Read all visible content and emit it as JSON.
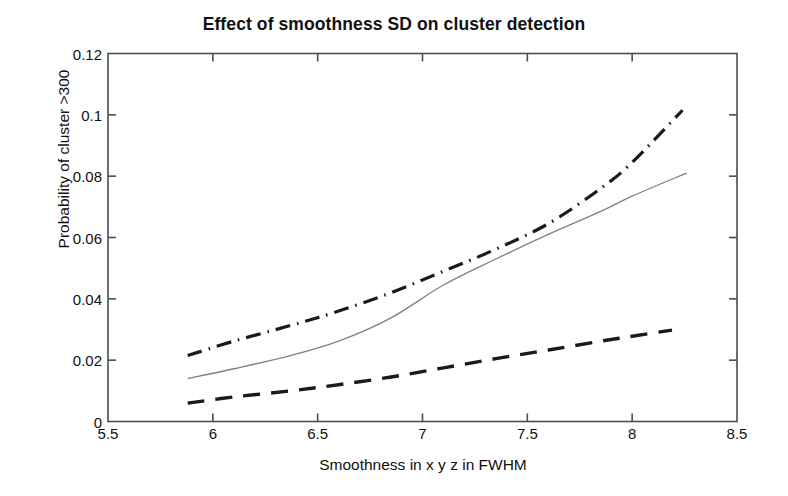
{
  "chart_data": {
    "type": "line",
    "title": "Effect of smoothness SD on cluster  detection",
    "xlabel": "Smoothness in x y z in FWHM",
    "ylabel": "Probability of cluster >300",
    "xlim": [
      5.5,
      8.5
    ],
    "ylim": [
      0,
      0.12
    ],
    "xticks": [
      "5.5",
      "6",
      "6.5",
      "7",
      "7.5",
      "8",
      "8.5"
    ],
    "xtick_values": [
      5.5,
      6,
      6.5,
      7,
      7.5,
      8,
      8.5
    ],
    "yticks": [
      "0",
      "0.02",
      "0.04",
      "0.06",
      "0.08",
      "0.1",
      "0.12"
    ],
    "ytick_values": [
      0,
      0.02,
      0.04,
      0.06,
      0.08,
      0.1,
      0.12
    ],
    "grid": false,
    "legend": "none",
    "line_color": "#1a1a1a",
    "solid_line_color": "#808080",
    "axis_color": "#4d4d4d",
    "series": [
      {
        "name": "dash-dot curve (upper)",
        "style": "dash-dot",
        "color": "#1a1a1a",
        "x": [
          5.88,
          6.1,
          6.37,
          6.6,
          6.85,
          7.1,
          7.35,
          7.6,
          7.85,
          8.0,
          8.24
        ],
        "values": [
          0.0215,
          0.0262,
          0.0313,
          0.036,
          0.042,
          0.049,
          0.0562,
          0.0645,
          0.076,
          0.0845,
          0.1015
        ]
      },
      {
        "name": "solid curve (middle)",
        "style": "solid",
        "color": "#808080",
        "x": [
          5.88,
          6.1,
          6.37,
          6.6,
          6.85,
          7.1,
          7.35,
          7.6,
          7.85,
          8.0,
          8.26
        ],
        "values": [
          0.014,
          0.0172,
          0.0215,
          0.0262,
          0.0338,
          0.0445,
          0.053,
          0.061,
          0.0685,
          0.0735,
          0.081
        ]
      },
      {
        "name": "dashed curve (lower)",
        "style": "dashed",
        "color": "#1a1a1a",
        "x": [
          5.88,
          6.1,
          6.37,
          6.6,
          6.85,
          7.1,
          7.35,
          7.6,
          7.85,
          8.0,
          8.19
        ],
        "values": [
          0.006,
          0.008,
          0.01,
          0.012,
          0.0145,
          0.0175,
          0.0205,
          0.0233,
          0.0262,
          0.0278,
          0.0298
        ]
      }
    ]
  }
}
